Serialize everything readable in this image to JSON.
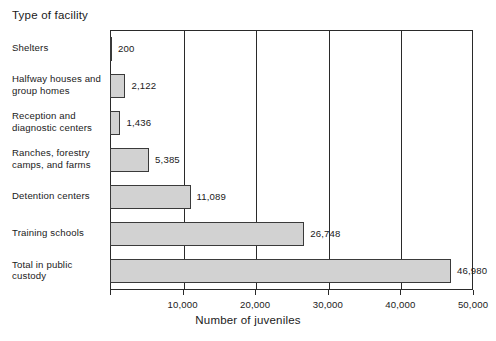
{
  "chart_data": {
    "type": "bar",
    "orientation": "horizontal",
    "title": "",
    "xlabel": "Number of juveniles",
    "ylabel": "Type of facility",
    "categories": [
      "Shelters",
      "Halfway houses and group homes",
      "Reception and diagnostic centers",
      "Ranches, forestry camps, and farms",
      "Detention centers",
      "Training schools",
      "Total in public custody"
    ],
    "category_lines": [
      [
        "Shelters"
      ],
      [
        "Halfway houses and",
        "group homes"
      ],
      [
        "Reception and",
        "diagnostic centers"
      ],
      [
        "Ranches, forestry",
        "camps, and farms"
      ],
      [
        "Detention centers"
      ],
      [
        "Training schools"
      ],
      [
        "Total in public",
        "custody"
      ]
    ],
    "values": [
      200,
      2122,
      1436,
      5385,
      11089,
      26748,
      46980
    ],
    "value_labels": [
      "200",
      "2,122",
      "1,436",
      "5,385",
      "11,089",
      "26,748",
      "46,980"
    ],
    "xlim": [
      0,
      50000
    ],
    "xticks": [
      0,
      10000,
      20000,
      30000,
      40000,
      50000
    ],
    "xtick_labels": [
      "",
      "10,000",
      "20,000",
      "30,000",
      "40,000",
      "50,000"
    ],
    "grid": true,
    "grid_axis": "x",
    "legend": false,
    "bar_fill_color": "#d2d2d2",
    "bar_edge_color": "#3a3a3a",
    "axis_color": "#2a2a2a",
    "background_color": "#ffffff"
  }
}
